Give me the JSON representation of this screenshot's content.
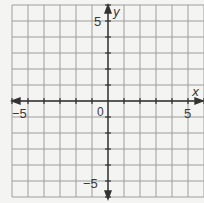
{
  "graph": {
    "type": "coordinate-plane",
    "x_axis_label": "x",
    "y_axis_label": "y",
    "origin_label": "0",
    "x_min": -6,
    "x_max": 6,
    "y_min": -6,
    "y_max": 6,
    "grid_step": 1,
    "tick_labels": {
      "x_neg": "−5",
      "x_pos": "5",
      "y_pos": "5",
      "y_neg": "−5"
    },
    "colors": {
      "grid": "#9a9a9a",
      "axis": "#333333",
      "background": "#f4f4f2"
    }
  }
}
